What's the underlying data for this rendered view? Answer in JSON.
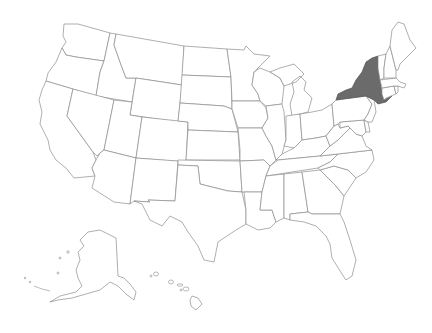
{
  "map": {
    "title": "United States",
    "type": "choropleth-outline",
    "colors": {
      "background": "#ffffff",
      "state_fill": "#ffffff",
      "state_stroke": "#8c8c8c",
      "highlight_fill": "#6b6b6b"
    },
    "highlighted_states": [
      "New York"
    ],
    "states": [
      {
        "id": "WA",
        "name": "Washington",
        "highlighted": false
      },
      {
        "id": "OR",
        "name": "Oregon",
        "highlighted": false
      },
      {
        "id": "CA",
        "name": "California",
        "highlighted": false
      },
      {
        "id": "ID",
        "name": "Idaho",
        "highlighted": false
      },
      {
        "id": "NV",
        "name": "Nevada",
        "highlighted": false
      },
      {
        "id": "MT",
        "name": "Montana",
        "highlighted": false
      },
      {
        "id": "WY",
        "name": "Wyoming",
        "highlighted": false
      },
      {
        "id": "UT",
        "name": "Utah",
        "highlighted": false
      },
      {
        "id": "AZ",
        "name": "Arizona",
        "highlighted": false
      },
      {
        "id": "CO",
        "name": "Colorado",
        "highlighted": false
      },
      {
        "id": "NM",
        "name": "New Mexico",
        "highlighted": false
      },
      {
        "id": "ND",
        "name": "North Dakota",
        "highlighted": false
      },
      {
        "id": "SD",
        "name": "South Dakota",
        "highlighted": false
      },
      {
        "id": "NE",
        "name": "Nebraska",
        "highlighted": false
      },
      {
        "id": "KS",
        "name": "Kansas",
        "highlighted": false
      },
      {
        "id": "OK",
        "name": "Oklahoma",
        "highlighted": false
      },
      {
        "id": "TX",
        "name": "Texas",
        "highlighted": false
      },
      {
        "id": "MN",
        "name": "Minnesota",
        "highlighted": false
      },
      {
        "id": "IA",
        "name": "Iowa",
        "highlighted": false
      },
      {
        "id": "MO",
        "name": "Missouri",
        "highlighted": false
      },
      {
        "id": "AR",
        "name": "Arkansas",
        "highlighted": false
      },
      {
        "id": "LA",
        "name": "Louisiana",
        "highlighted": false
      },
      {
        "id": "WI",
        "name": "Wisconsin",
        "highlighted": false
      },
      {
        "id": "IL",
        "name": "Illinois",
        "highlighted": false
      },
      {
        "id": "MI",
        "name": "Michigan",
        "highlighted": false
      },
      {
        "id": "IN",
        "name": "Indiana",
        "highlighted": false
      },
      {
        "id": "OH",
        "name": "Ohio",
        "highlighted": false
      },
      {
        "id": "KY",
        "name": "Kentucky",
        "highlighted": false
      },
      {
        "id": "TN",
        "name": "Tennessee",
        "highlighted": false
      },
      {
        "id": "MS",
        "name": "Mississippi",
        "highlighted": false
      },
      {
        "id": "AL",
        "name": "Alabama",
        "highlighted": false
      },
      {
        "id": "GA",
        "name": "Georgia",
        "highlighted": false
      },
      {
        "id": "FL",
        "name": "Florida",
        "highlighted": false
      },
      {
        "id": "SC",
        "name": "South Carolina",
        "highlighted": false
      },
      {
        "id": "NC",
        "name": "North Carolina",
        "highlighted": false
      },
      {
        "id": "VA",
        "name": "Virginia",
        "highlighted": false
      },
      {
        "id": "WV",
        "name": "West Virginia",
        "highlighted": false
      },
      {
        "id": "MD",
        "name": "Maryland",
        "highlighted": false
      },
      {
        "id": "DE",
        "name": "Delaware",
        "highlighted": false
      },
      {
        "id": "PA",
        "name": "Pennsylvania",
        "highlighted": false
      },
      {
        "id": "NJ",
        "name": "New Jersey",
        "highlighted": false
      },
      {
        "id": "NY",
        "name": "New York",
        "highlighted": true
      },
      {
        "id": "CT",
        "name": "Connecticut",
        "highlighted": false
      },
      {
        "id": "RI",
        "name": "Rhode Island",
        "highlighted": false
      },
      {
        "id": "MA",
        "name": "Massachusetts",
        "highlighted": false
      },
      {
        "id": "VT",
        "name": "Vermont",
        "highlighted": false
      },
      {
        "id": "NH",
        "name": "New Hampshire",
        "highlighted": false
      },
      {
        "id": "ME",
        "name": "Maine",
        "highlighted": false
      },
      {
        "id": "AK",
        "name": "Alaska",
        "highlighted": false
      },
      {
        "id": "HI",
        "name": "Hawaii",
        "highlighted": false
      }
    ]
  }
}
